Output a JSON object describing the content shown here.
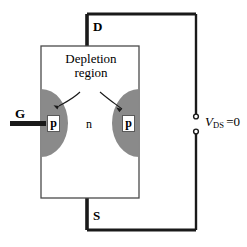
{
  "figure": {
    "type": "jfet-cross-section-circuit",
    "title": "",
    "background_color": "#ffffff",
    "line_color": "#1a1a1a",
    "depletion_fill": "#8a8a8a",
    "body_fill": "#ffffff",
    "p_box_fill": "#ffffff"
  },
  "labels": {
    "drain": "D",
    "source": "S",
    "gate": "G",
    "channel": "n",
    "p_left": "p",
    "p_right": "p",
    "caption_line1": "Depletion",
    "caption_line2": "region"
  },
  "annotation": {
    "voltage_symbol": "V",
    "voltage_subscript": "DS",
    "equals_value": "=0"
  },
  "geometry": {
    "body_rect": {
      "x": 41,
      "y": 46,
      "w": 98,
      "h": 152
    },
    "circuit_top_y": 14,
    "circuit_bottom_y": 230,
    "circuit_right_x": 196,
    "drain_lead_x": 87,
    "source_lead_x": 87,
    "gate_lead": {
      "x1": 10,
      "x2": 46,
      "y": 123
    },
    "terminal_gap": {
      "x": 196,
      "y_top": 117,
      "y_bottom": 131
    }
  }
}
